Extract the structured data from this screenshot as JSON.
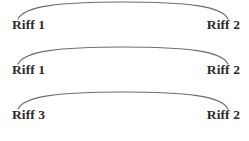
{
  "diagram": {
    "background_color": "#ffffff",
    "arc_color": "#6e6e6e",
    "label_color": "#2b2b2b",
    "rows": [
      {
        "left_label": "Riff 1",
        "right_label": "Riff 2",
        "arc": "M 18 19 C 24 6, 60 2, 123 2 C 186 2, 222 6, 228 19"
      },
      {
        "left_label": "Riff 1",
        "right_label": "Riff 2",
        "arc": "M 18 19 C 24 6, 60 2, 123 2 C 186 2, 222 6, 228 19"
      },
      {
        "left_label": "Riff 3",
        "right_label": "Riff 2",
        "arc": "M 18 19 C 24 6, 60 2, 123 2 C 186 2, 222 6, 228 19"
      }
    ]
  }
}
